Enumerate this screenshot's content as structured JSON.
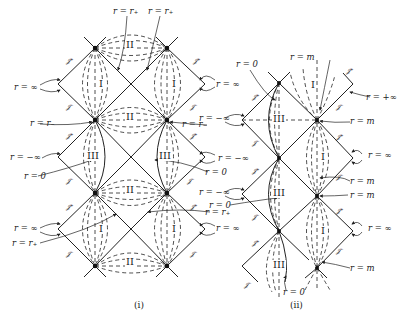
{
  "diagram_i": {
    "caption": "(i)",
    "top_labels": [
      "r = r₊",
      "r = r₊"
    ],
    "left_labels": [
      "r = ∞",
      "r = r₋",
      "r = −∞",
      "r = 0",
      "r = ∞",
      "r = r₊"
    ],
    "right_labels": [
      "r = ∞",
      "r = r₋",
      "r = −∞",
      "r = 0",
      "r = r₊",
      "r = ∞"
    ],
    "regions": [
      "II",
      "I",
      "I",
      "II",
      "III",
      "III",
      "II",
      "I",
      "I",
      "II"
    ],
    "scri_plus": "𝒥⁺",
    "scri_minus": "𝒥⁻"
  },
  "diagram_ii": {
    "caption": "(ii)",
    "labels": {
      "top_r0": "r = 0",
      "top_rm": "r = m",
      "r_plus_inf": "r = +∞",
      "left": [
        "r = ∞",
        "r = −∞",
        "r = −∞",
        "r = 0",
        "r = ∞"
      ],
      "right": [
        "r = m",
        "r = ∞",
        "r = m",
        "r = m",
        "r = ∞",
        "r = m"
      ],
      "bottom_r0": "r = 0"
    },
    "regions": [
      "I",
      "III",
      "I",
      "III",
      "I",
      "III"
    ],
    "scri_plus": "𝒥⁺",
    "scri_minus": "𝒥⁻"
  }
}
